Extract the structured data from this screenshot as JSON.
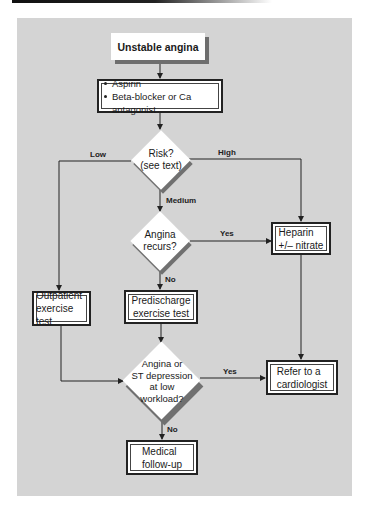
{
  "flowchart": {
    "start": {
      "label": "Unstable angina"
    },
    "initial_treatment": {
      "items": [
        "Aspirin",
        "Beta-blocker or Ca antagonist"
      ]
    },
    "risk_decision": {
      "line1": "Risk?",
      "line2": "(see text)"
    },
    "branch_labels": {
      "low": "Low",
      "high": "High",
      "medium": "Medium",
      "yes1": "Yes",
      "no1": "No",
      "yes2": "Yes",
      "no2": "No"
    },
    "recur_decision": {
      "line1": "Angina",
      "line2": "recurs?"
    },
    "heparin": {
      "line1": "Heparin",
      "line2": "+/– nitrate"
    },
    "outpatient": {
      "line1": "Outpatient",
      "line2": "exercise test"
    },
    "predischarge": {
      "line1": "Predischarge",
      "line2": "exercise test"
    },
    "st_decision": {
      "line1": "Angina or",
      "line2": "ST depression",
      "line3": "at low",
      "line4": "workload?"
    },
    "refer": {
      "line1": "Refer to a",
      "line2": "cardiologist"
    },
    "medical": {
      "line1": "Medical",
      "line2": "follow-up"
    }
  },
  "colors": {
    "panel": "#d4d4d4",
    "box": "#ffffff",
    "line": "#222222",
    "shadow": "#707070"
  }
}
